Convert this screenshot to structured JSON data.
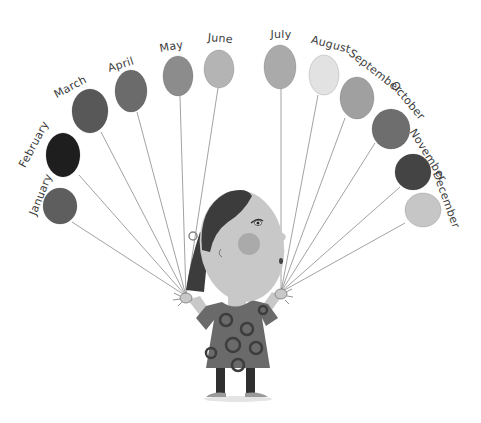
{
  "illustration": {
    "subject": "girl holding twelve balloons",
    "months": [
      {
        "label": "January",
        "color": "#5e5e5e",
        "cx": 60,
        "cy": 206,
        "rx": 17,
        "ry": 18,
        "lx": 44,
        "ly": 196,
        "rot": -68,
        "sx": 72,
        "sy": 222
      },
      {
        "label": "February",
        "color": "#1e1e1e",
        "cx": 63,
        "cy": 155,
        "rx": 17,
        "ry": 22,
        "lx": 37,
        "ly": 146,
        "rot": -62,
        "sx": 79,
        "sy": 175
      },
      {
        "label": "March",
        "color": "#585858",
        "cx": 90,
        "cy": 111,
        "rx": 18,
        "ry": 22,
        "lx": 72,
        "ly": 90,
        "rot": -28,
        "sx": 101,
        "sy": 132
      },
      {
        "label": "April",
        "color": "#6b6b6b",
        "cx": 131,
        "cy": 91,
        "rx": 16,
        "ry": 21,
        "lx": 122,
        "ly": 68,
        "rot": -18,
        "sx": 137,
        "sy": 112
      },
      {
        "label": "May",
        "color": "#8c8c8c",
        "cx": 178,
        "cy": 76,
        "rx": 15,
        "ry": 20,
        "lx": 172,
        "ly": 50,
        "rot": -10,
        "sx": 180,
        "sy": 96
      },
      {
        "label": "June",
        "color": "#b4b4b4",
        "cx": 219,
        "cy": 69,
        "rx": 15,
        "ry": 19,
        "lx": 220,
        "ly": 42,
        "rot": 5,
        "sx": 218,
        "sy": 88
      },
      {
        "label": "July",
        "color": "#aaaaaa",
        "cx": 280,
        "cy": 67,
        "rx": 16,
        "ry": 22,
        "lx": 281,
        "ly": 38,
        "rot": 0,
        "sx": 281,
        "sy": 89
      },
      {
        "label": "August",
        "color": "#e2e2e2",
        "cx": 324,
        "cy": 75,
        "rx": 15,
        "ry": 20,
        "lx": 330,
        "ly": 48,
        "rot": 15,
        "sx": 318,
        "sy": 95
      },
      {
        "label": "September",
        "color": "#a0a0a0",
        "cx": 357,
        "cy": 98,
        "rx": 17,
        "ry": 21,
        "lx": 373,
        "ly": 74,
        "rot": 38,
        "sx": 345,
        "sy": 118
      },
      {
        "label": "October",
        "color": "#6e6e6e",
        "cx": 391,
        "cy": 129,
        "rx": 19,
        "ry": 20,
        "lx": 405,
        "ly": 103,
        "rot": 50,
        "sx": 375,
        "sy": 143
      },
      {
        "label": "November",
        "color": "#444444",
        "cx": 413,
        "cy": 172,
        "rx": 18,
        "ry": 18,
        "lx": 425,
        "ly": 157,
        "rot": 58,
        "sx": 400,
        "sy": 187
      },
      {
        "label": "December",
        "color": "#c6c6c6",
        "cx": 423,
        "cy": 210,
        "rx": 18,
        "ry": 17,
        "lx": 443,
        "ly": 201,
        "rot": 70,
        "sx": 405,
        "sy": 223
      }
    ],
    "colors": {
      "string": "#8a8a8a",
      "label": "#3a3a3a",
      "hair": "#3c3c3c",
      "skin": "#c8c8c8",
      "cheek": "#a3a3a3",
      "dress": "#6a6a6a",
      "dress_dots": "#3d3d3d",
      "legs": "#2f2f2f",
      "shoes": "#9a9a9a"
    },
    "hands": {
      "left": {
        "x": 186,
        "y": 296
      },
      "right": {
        "x": 281,
        "y": 292
      }
    }
  }
}
